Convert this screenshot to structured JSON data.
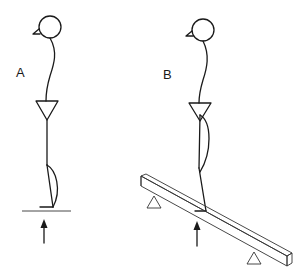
{
  "figure": {
    "panels": [
      {
        "id": "A",
        "label": "A",
        "description": "Stick figure standing on flat ground with upward force arrow"
      },
      {
        "id": "B",
        "label": "B",
        "description": "Stick figure standing on an inclined beam supported by two triangular supports with upward force arrow"
      }
    ],
    "colors": {
      "line": "#1a1a1a",
      "background": "#ffffff"
    }
  }
}
